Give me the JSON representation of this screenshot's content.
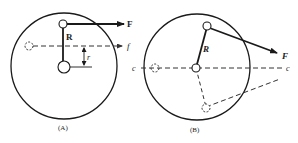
{
  "figure": {
    "panels": [
      {
        "id": "A",
        "caption": "(A)",
        "labels": {
          "radius": "R",
          "force": "F",
          "force_line": "f",
          "offset": "r"
        }
      },
      {
        "id": "B",
        "caption": "(B)",
        "labels": {
          "radius": "R",
          "force": "F",
          "line_left": "c",
          "line_right": "c"
        }
      }
    ],
    "colors": {
      "stroke": "#1a1a1a",
      "dashed": "#444444",
      "background": "#ffffff"
    }
  }
}
